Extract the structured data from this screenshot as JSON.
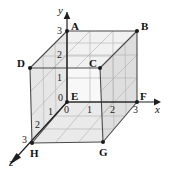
{
  "figure": {
    "background_color": "#ffffff",
    "line_color": "#3a3a3a",
    "grid_color": "#b4b4b4",
    "axes": [
      {
        "name": "x",
        "label": "x",
        "arrow": "right"
      },
      {
        "name": "y",
        "label": "y",
        "arrow": "up"
      },
      {
        "name": "z",
        "label": "z",
        "arrow": "down-left"
      }
    ],
    "axis_labels": {
      "x": "x",
      "y": "y",
      "z": "z"
    },
    "origin_label": "0",
    "ticks": {
      "x": [
        "0",
        "1",
        "2",
        "3"
      ],
      "y": [
        "0",
        "1",
        "2",
        "3"
      ],
      "z": [
        "0",
        "1",
        "2",
        "3"
      ]
    },
    "vertices": [
      {
        "name": "A",
        "label": "A",
        "x": 0,
        "y": 3,
        "z": 0
      },
      {
        "name": "B",
        "label": "B",
        "x": 3,
        "y": 3,
        "z": 0
      },
      {
        "name": "C",
        "label": "C",
        "x": 3,
        "y": 3,
        "z": 3
      },
      {
        "name": "D",
        "label": "D",
        "x": 0,
        "y": 3,
        "z": 3
      },
      {
        "name": "E",
        "label": "E",
        "x": 0,
        "y": 0,
        "z": 0
      },
      {
        "name": "F",
        "label": "F",
        "x": 3,
        "y": 0,
        "z": 0
      },
      {
        "name": "G",
        "label": "G",
        "x": 3,
        "y": 0,
        "z": 3
      },
      {
        "name": "H",
        "label": "H",
        "x": 0,
        "y": 0,
        "z": 3
      }
    ],
    "faces": {
      "top_shade": "#f2f2f2",
      "left_shade": "#e4e4e4",
      "right_shade": "#dcdcdc",
      "bottom_shade": "#e8e8e8",
      "back_shade": "#f7f7f7"
    }
  }
}
